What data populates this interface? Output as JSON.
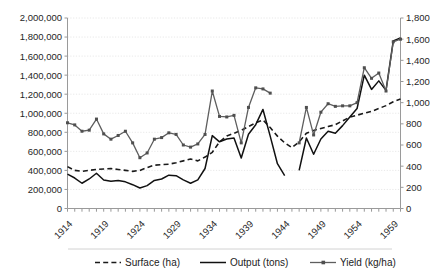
{
  "chart_data": {
    "type": "line",
    "title": "",
    "subtitle": "",
    "xlabel": "",
    "ylabel": "",
    "y2label": "",
    "grid": true,
    "legend_position": "bottom",
    "x": [
      1914,
      1915,
      1916,
      1917,
      1918,
      1919,
      1920,
      1921,
      1922,
      1923,
      1924,
      1925,
      1926,
      1927,
      1928,
      1929,
      1930,
      1931,
      1932,
      1933,
      1934,
      1935,
      1936,
      1937,
      1938,
      1939,
      1940,
      1941,
      1942,
      1943,
      1944,
      1945,
      1946,
      1947,
      1948,
      1949,
      1950,
      1951,
      1952,
      1953,
      1954,
      1955,
      1956,
      1957,
      1958,
      1959,
      1960
    ],
    "xticks": [
      1914,
      1919,
      1924,
      1929,
      1934,
      1939,
      1944,
      1949,
      1954,
      1959
    ],
    "ylim": [
      0,
      2000000
    ],
    "yticks": [
      0,
      200000,
      400000,
      600000,
      800000,
      1000000,
      1200000,
      1400000,
      1600000,
      1800000,
      2000000
    ],
    "ytick_labels": [
      "0",
      "200,000",
      "400,000",
      "600,000",
      "800,000",
      "1,000,000",
      "1,200,000",
      "1,400,000",
      "1,600,000",
      "1,800,000",
      "2,000,000"
    ],
    "y2lim": [
      0,
      1800
    ],
    "y2ticks": [
      0,
      200,
      400,
      600,
      800,
      1000,
      1200,
      1400,
      1600,
      1800
    ],
    "y2tick_labels": [
      "0",
      "200",
      "400",
      "600",
      "800",
      "1,000",
      "1,200",
      "1,400",
      "1,600",
      "1,800"
    ],
    "series": [
      {
        "name": "Surface (ha)",
        "axis": "left",
        "style": "dashed",
        "marker": "none",
        "color": "#1a1a1a",
        "values": [
          440000,
          400000,
          390000,
          400000,
          410000,
          415000,
          420000,
          410000,
          400000,
          390000,
          400000,
          430000,
          455000,
          460000,
          465000,
          480000,
          500000,
          520000,
          500000,
          540000,
          590000,
          700000,
          760000,
          790000,
          820000,
          860000,
          900000,
          930000,
          850000,
          760000,
          690000,
          640000,
          700000,
          790000,
          820000,
          840000,
          860000,
          880000,
          920000,
          960000,
          980000,
          1000000,
          1020000,
          1050000,
          1080000,
          1120000,
          1150000
        ]
      },
      {
        "name": "Output (tons)",
        "axis": "left",
        "style": "solid",
        "marker": "none",
        "color": "#111111",
        "values": [
          360000,
          320000,
          265000,
          310000,
          370000,
          300000,
          285000,
          295000,
          280000,
          250000,
          215000,
          240000,
          295000,
          310000,
          350000,
          345000,
          300000,
          265000,
          300000,
          420000,
          765000,
          700000,
          730000,
          740000,
          530000,
          780000,
          880000,
          1040000,
          760000,
          470000,
          345000,
          null,
          400000,
          740000,
          570000,
          730000,
          810000,
          790000,
          870000,
          960000,
          1050000,
          1400000,
          1250000,
          1340000,
          1240000,
          1760000,
          1790000
        ]
      },
      {
        "name": "Yield (kg/ha)",
        "axis": "right",
        "style": "solid",
        "marker": "square",
        "color": "#5e5e5e",
        "values": [
          810,
          790,
          730,
          740,
          845,
          705,
          655,
          690,
          730,
          620,
          480,
          525,
          655,
          670,
          715,
          700,
          600,
          580,
          610,
          700,
          1110,
          870,
          865,
          880,
          620,
          955,
          1140,
          1130,
          1090,
          null,
          null,
          null,
          620,
          955,
          695,
          910,
          990,
          965,
          970,
          970,
          1000,
          1330,
          1230,
          1280,
          1110,
          1575,
          1600
        ]
      }
    ],
    "notes": [
      "Output (tons) and Yield (kg/ha) have a data gap for the war years; segments break and resume.",
      "Yield (kg/ha) plotted against the secondary (right) axis."
    ]
  },
  "legend": {
    "items": [
      {
        "label": "Surface (ha)",
        "style": "dashed",
        "marker": "none"
      },
      {
        "label": "Output (tons)",
        "style": "solid",
        "marker": "none"
      },
      {
        "label": "Yield (kg/ha)",
        "style": "solid",
        "marker": "square"
      }
    ]
  }
}
